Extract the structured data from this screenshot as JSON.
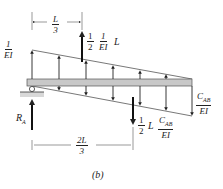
{
  "figure": {
    "caption": "(b)",
    "labels": {
      "left_load": {
        "num": "1",
        "den": "EI"
      },
      "dim_top": {
        "num": "L",
        "den": "3"
      },
      "upward_resultant": {
        "half_num": "1",
        "half_den": "2",
        "frac_num": "1",
        "frac_den": "EI",
        "suffix": "L"
      },
      "right_load": {
        "num": "C",
        "num_sub": "AB",
        "den": "EI"
      },
      "downward_resultant": {
        "half_num": "1",
        "half_den": "2",
        "mid": "L",
        "frac_num": "C",
        "frac_sub": "AB",
        "frac_den": "EI"
      },
      "reaction": {
        "main": "R",
        "sub": "A"
      },
      "dim_bottom": {
        "num": "2L",
        "den": "3"
      }
    }
  }
}
